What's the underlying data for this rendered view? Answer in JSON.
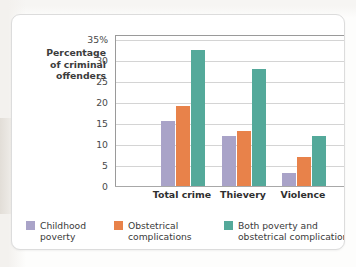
{
  "chart_data": {
    "type": "bar",
    "title": "",
    "xlabel": "",
    "ylabel": "Percentage of criminal offenders",
    "categories": [
      "Total crime",
      "Thievery",
      "Violence"
    ],
    "series": [
      {
        "name": "Childhood poverty",
        "color": "#a9a3c8",
        "values": [
          15.5,
          12,
          3
        ]
      },
      {
        "name": "Obstetrical complications",
        "color": "#e8824a",
        "values": [
          19,
          13,
          7
        ]
      },
      {
        "name": "Both poverty and obstetrical complications",
        "color": "#54a99a",
        "values": [
          32.5,
          28,
          12
        ]
      }
    ],
    "ylim": [
      0,
      36
    ],
    "yticks": [
      0,
      5,
      10,
      15,
      20,
      25,
      30,
      35
    ],
    "ytick_labels": [
      "0",
      "5",
      "10",
      "15",
      "20",
      "25",
      "30",
      "35%"
    ],
    "grid": true,
    "legend_position": "bottom"
  },
  "axis": {
    "y_title_lines": [
      "Percentage",
      "of criminal",
      "offenders"
    ]
  },
  "legend": {
    "items": [
      {
        "label_lines": [
          "Childhood",
          "poverty"
        ],
        "color": "#a9a3c8"
      },
      {
        "label_lines": [
          "Obstetrical",
          "complications"
        ],
        "color": "#e8824a"
      },
      {
        "label_lines": [
          "Both poverty and",
          "obstetrical complications"
        ],
        "color": "#54a99a"
      }
    ]
  }
}
